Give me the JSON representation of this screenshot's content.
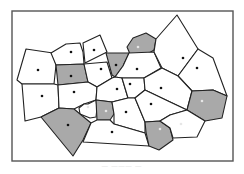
{
  "diagram": {
    "type": "voronoi-tessellation",
    "frame": {
      "x": 12,
      "y": 11,
      "width": 221,
      "height": 150,
      "stroke": "#555555"
    },
    "colors": {
      "cell_fill": "#ffffff",
      "cell_fill_shaded": "#a9a9a9",
      "edge": "#222222",
      "site_dark": "#111111",
      "site_light": "#e6e6e6"
    },
    "cells": [
      {
        "id": "c1",
        "shaded": false,
        "points": [
          [
            26,
            49
          ],
          [
            53,
            53
          ],
          [
            56,
            65
          ],
          [
            54,
            84
          ],
          [
            22,
            84
          ],
          [
            17,
            80
          ]
        ],
        "site": [
          38,
          70
        ],
        "site_light": false
      },
      {
        "id": "c2",
        "shaded": false,
        "points": [
          [
            51,
            53
          ],
          [
            66,
            44
          ],
          [
            80,
            43
          ],
          [
            83,
            52
          ],
          [
            84,
            64
          ],
          [
            56,
            65
          ]
        ],
        "site": [
          71,
          52
        ],
        "site_light": false
      },
      {
        "id": "c3",
        "shaded": false,
        "points": [
          [
            83,
            43
          ],
          [
            100,
            35
          ],
          [
            107,
            52
          ],
          [
            85,
            63
          ]
        ],
        "site": [
          94,
          50
        ],
        "site_light": false
      },
      {
        "id": "c4",
        "shaded": true,
        "points": [
          [
            56,
            65
          ],
          [
            84,
            64
          ],
          [
            88,
            82
          ],
          [
            58,
            85
          ]
        ],
        "site": [
          71,
          76
        ],
        "site_light": false
      },
      {
        "id": "c5",
        "shaded": false,
        "points": [
          [
            84,
            64
          ],
          [
            107,
            62
          ],
          [
            112,
            78
          ],
          [
            97,
            87
          ],
          [
            88,
            82
          ]
        ],
        "site": [
          101,
          69
        ],
        "site_light": false
      },
      {
        "id": "c6",
        "shaded": true,
        "points": [
          [
            106,
            53
          ],
          [
            129,
            53
          ],
          [
            123,
            66
          ],
          [
            115,
            77
          ],
          [
            112,
            75
          ]
        ],
        "site": [
          116,
          65
        ],
        "site_light": false
      },
      {
        "id": "c7",
        "shaded": true,
        "points": [
          [
            133,
            38
          ],
          [
            146,
            33
          ],
          [
            156,
            39
          ],
          [
            154,
            50
          ],
          [
            146,
            55
          ],
          [
            130,
            54
          ],
          [
            127,
            47
          ]
        ],
        "site": [
          138,
          47
        ],
        "site_light": true
      },
      {
        "id": "c8",
        "shaded": false,
        "points": [
          [
            129,
            53
          ],
          [
            154,
            52
          ],
          [
            161,
            68
          ],
          [
            144,
            78
          ],
          [
            122,
            78
          ],
          [
            115,
            77
          ],
          [
            123,
            66
          ]
        ],
        "site": [
          137,
          69
        ],
        "site_light": false
      },
      {
        "id": "c9",
        "shaded": false,
        "points": [
          [
            156,
            39
          ],
          [
            177,
            15
          ],
          [
            198,
            49
          ],
          [
            178,
            76
          ],
          [
            162,
            68
          ],
          [
            154,
            52
          ]
        ],
        "site": [
          183,
          58
        ],
        "site_light": false
      },
      {
        "id": "c10",
        "shaded": false,
        "points": [
          [
            198,
            49
          ],
          [
            213,
            58
          ],
          [
            227,
            96
          ],
          [
            213,
            90
          ],
          [
            192,
            91
          ],
          [
            178,
            76
          ]
        ],
        "site": [
          197,
          68
        ],
        "site_light": false
      },
      {
        "id": "c11",
        "shaded": false,
        "points": [
          [
            22,
            84
          ],
          [
            54,
            84
          ],
          [
            58,
            85
          ],
          [
            59,
            108
          ],
          [
            41,
            117
          ],
          [
            25,
            121
          ]
        ],
        "site": [
          42,
          96
        ],
        "site_light": false
      },
      {
        "id": "c12",
        "shaded": false,
        "points": [
          [
            58,
            85
          ],
          [
            88,
            82
          ],
          [
            97,
            87
          ],
          [
            96,
            100
          ],
          [
            84,
            104
          ],
          [
            74,
            109
          ],
          [
            59,
            108
          ]
        ],
        "site": [
          74,
          92
        ],
        "site_light": false
      },
      {
        "id": "c13",
        "shaded": false,
        "points": [
          [
            97,
            87
          ],
          [
            112,
            78
          ],
          [
            115,
            77
          ],
          [
            122,
            78
          ],
          [
            128,
            98
          ],
          [
            112,
            102
          ],
          [
            96,
            100
          ]
        ],
        "site": [
          117,
          89
        ],
        "site_light": false
      },
      {
        "id": "c14",
        "shaded": false,
        "points": [
          [
            122,
            78
          ],
          [
            144,
            78
          ],
          [
            145,
            90
          ],
          [
            135,
            98
          ],
          [
            128,
            98
          ]
        ],
        "site": [
          130,
          84
        ],
        "site_light": false
      },
      {
        "id": "c15",
        "shaded": false,
        "points": [
          [
            144,
            78
          ],
          [
            162,
            68
          ],
          [
            178,
            76
          ],
          [
            192,
            91
          ],
          [
            187,
            110
          ],
          [
            168,
            101
          ],
          [
            145,
            90
          ]
        ],
        "site": [
          161,
          88
        ],
        "site_light": false
      },
      {
        "id": "c16",
        "shaded": true,
        "points": [
          [
            192,
            91
          ],
          [
            213,
            90
          ],
          [
            227,
            96
          ],
          [
            222,
            118
          ],
          [
            205,
            121
          ],
          [
            187,
            110
          ]
        ],
        "site": [
          202,
          101
        ],
        "site_light": true
      },
      {
        "id": "c17",
        "shaded": false,
        "points": [
          [
            88,
            104
          ],
          [
            96,
            100
          ],
          [
            97,
            108
          ],
          [
            96,
            117
          ],
          [
            90,
            118
          ],
          [
            80,
            114
          ],
          [
            79,
            108
          ],
          [
            84,
            104
          ]
        ],
        "site": [
          88,
          107
        ],
        "site_light": true
      },
      {
        "id": "c18",
        "shaded": true,
        "points": [
          [
            96,
            100
          ],
          [
            112,
            102
          ],
          [
            114,
            114
          ],
          [
            110,
            120
          ],
          [
            97,
            120
          ]
        ],
        "site": [
          106,
          111
        ],
        "site_light": true
      },
      {
        "id": "c19",
        "shaded": false,
        "points": [
          [
            112,
            102
          ],
          [
            128,
            98
          ],
          [
            135,
            98
          ],
          [
            145,
            122
          ],
          [
            145,
            133
          ],
          [
            114,
            124
          ],
          [
            114,
            114
          ]
        ],
        "site": [
          126,
          112
        ],
        "site_light": false
      },
      {
        "id": "c20",
        "shaded": false,
        "points": [
          [
            135,
            98
          ],
          [
            145,
            90
          ],
          [
            168,
            101
          ],
          [
            187,
            110
          ],
          [
            170,
            115
          ],
          [
            160,
            121
          ],
          [
            145,
            122
          ]
        ],
        "site": [
          151,
          104
        ],
        "site_light": false
      },
      {
        "id": "c21",
        "shaded": true,
        "points": [
          [
            41,
            117
          ],
          [
            59,
            108
          ],
          [
            74,
            109
          ],
          [
            80,
            114
          ],
          [
            91,
            123
          ],
          [
            83,
            140
          ],
          [
            73,
            156
          ]
        ],
        "site": [
          68,
          125
        ],
        "site_light": false
      },
      {
        "id": "c22",
        "shaded": false,
        "points": [
          [
            91,
            123
          ],
          [
            97,
            120
          ],
          [
            110,
            120
          ],
          [
            114,
            124
          ],
          [
            145,
            133
          ],
          [
            149,
            146
          ],
          [
            83,
            142
          ]
        ],
        "site": [
          112,
          132
        ],
        "site_light": false
      },
      {
        "id": "c23",
        "shaded": true,
        "points": [
          [
            145,
            122
          ],
          [
            160,
            121
          ],
          [
            170,
            128
          ],
          [
            173,
            140
          ],
          [
            159,
            150
          ],
          [
            149,
            146
          ],
          [
            146,
            132
          ]
        ],
        "site": [
          160,
          129
        ],
        "site_light": true
      },
      {
        "id": "c24",
        "shaded": false,
        "points": [
          [
            160,
            121
          ],
          [
            170,
            115
          ],
          [
            187,
            110
          ],
          [
            205,
            121
          ],
          [
            197,
            137
          ],
          [
            173,
            138
          ],
          [
            170,
            128
          ]
        ],
        "site": [
          181,
          124
        ],
        "site_light": true
      }
    ]
  },
  "caption": {
    "text": "— ——— —"
  }
}
